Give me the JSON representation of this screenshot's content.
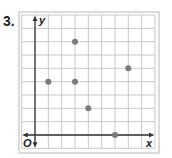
{
  "problem": {
    "number": "3."
  },
  "chart_data": {
    "type": "scatter",
    "title": "",
    "xlabel": "x",
    "ylabel": "y",
    "origin_label": "O",
    "xlim": [
      -1,
      9
    ],
    "ylim": [
      -1,
      9
    ],
    "grid": true,
    "points": [
      {
        "x": 1,
        "y": 4
      },
      {
        "x": 3,
        "y": 7
      },
      {
        "x": 3,
        "y": 4
      },
      {
        "x": 4,
        "y": 2
      },
      {
        "x": 6,
        "y": 0
      },
      {
        "x": 7,
        "y": 5
      }
    ]
  },
  "colors": {
    "grid": "#c8c8c8",
    "axis": "#333333",
    "point": "#7a7a7a",
    "frame": "#d0d0d0"
  }
}
